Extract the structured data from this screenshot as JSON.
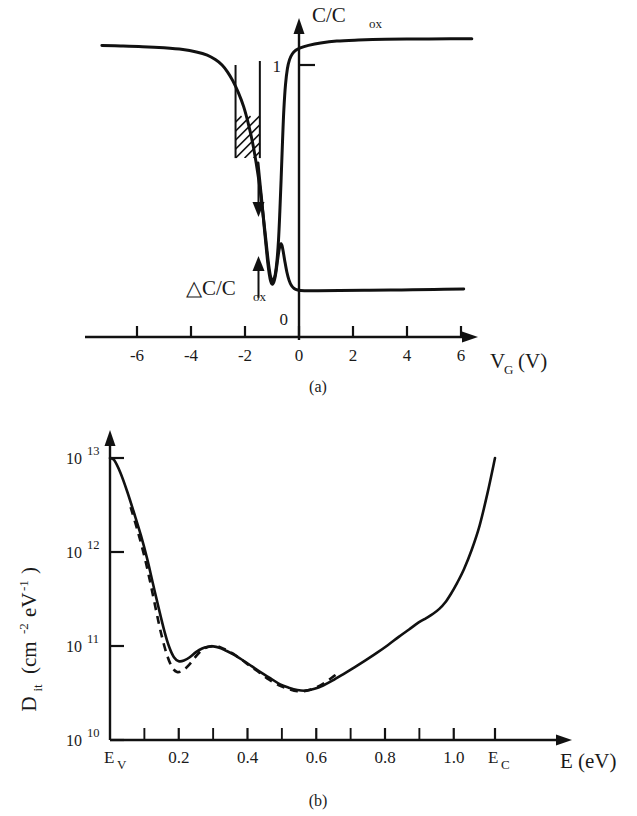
{
  "figure": {
    "panels": [
      {
        "id": "a",
        "caption": "(a)",
        "chart_data": {
          "type": "line",
          "title": "",
          "xlabel": "V_G (V)",
          "ylabel": "C/C_ox",
          "xlabel_base": "V",
          "xlabel_sub": "G",
          "xlabel_unit": "(V)",
          "ylabel_base": "C/C",
          "ylabel_sub": "ox",
          "x_ticks": [
            -6,
            -4,
            -2,
            0,
            2,
            4,
            6
          ],
          "x_tick_labels": [
            "-6",
            "-4",
            "-2",
            "0",
            "2",
            "4",
            "6"
          ],
          "xlim": [
            -7.4,
            7.0
          ],
          "y_tick_labels": [
            "1",
            "0"
          ],
          "y_tick_values": [
            1,
            0
          ],
          "ylim": [
            -0.12,
            1.28
          ],
          "grid": false,
          "legend": false,
          "annotations": [
            {
              "name": "delta-c-label",
              "text": "△C/C",
              "sub": "ox",
              "x": -2.1,
              "y": 0.12
            },
            {
              "name": "hatched-band",
              "x_from": -2.35,
              "x_to": -1.45,
              "y_top": 1.0,
              "y_bottom": 0.62
            },
            {
              "name": "down-arrow",
              "x": -1.5,
              "y_from": 0.57,
              "y_to": 0.38
            },
            {
              "name": "up-arrow",
              "x": -1.5,
              "y_from": 0.05,
              "y_to": 0.22
            }
          ],
          "series": [
            {
              "name": "high-frequency-cv-curve",
              "style": "solid",
              "points": [
                [
                  -7.3,
                  1.08
                ],
                [
                  -6.6,
                  1.078
                ],
                [
                  -5.8,
                  1.075
                ],
                [
                  -5.0,
                  1.07
                ],
                [
                  -4.3,
                  1.063
                ],
                [
                  -3.8,
                  1.053
                ],
                [
                  -3.4,
                  1.04
                ],
                [
                  -3.1,
                  1.022
                ],
                [
                  -2.85,
                  1.0
                ],
                [
                  -2.65,
                  0.972
                ],
                [
                  -2.45,
                  0.935
                ],
                [
                  -2.25,
                  0.888
                ],
                [
                  -2.05,
                  0.83
                ],
                [
                  -1.88,
                  0.762
                ],
                [
                  -1.72,
                  0.684
                ],
                [
                  -1.58,
                  0.596
                ],
                [
                  -1.46,
                  0.508
                ],
                [
                  -1.36,
                  0.418
                ],
                [
                  -1.27,
                  0.33
                ],
                [
                  -1.19,
                  0.248
                ],
                [
                  -1.12,
                  0.182
                ],
                [
                  -1.06,
                  0.14
                ],
                [
                  -1.0,
                  0.122
                ],
                [
                  -0.94,
                  0.124
                ],
                [
                  -0.88,
                  0.145
                ],
                [
                  -0.82,
                  0.196
                ],
                [
                  -0.76,
                  0.283
                ],
                [
                  -0.71,
                  0.4
                ],
                [
                  -0.66,
                  0.54
                ],
                [
                  -0.61,
                  0.69
                ],
                [
                  -0.56,
                  0.82
                ],
                [
                  -0.5,
                  0.92
                ],
                [
                  -0.43,
                  0.985
                ],
                [
                  -0.35,
                  1.022
                ],
                [
                  -0.25,
                  1.045
                ],
                [
                  -0.12,
                  1.06
                ],
                [
                  0.05,
                  1.07
                ],
                [
                  0.35,
                  1.08
                ],
                [
                  0.8,
                  1.09
                ],
                [
                  1.4,
                  1.098
                ],
                [
                  2.2,
                  1.102
                ],
                [
                  3.2,
                  1.105
                ],
                [
                  4.4,
                  1.106
                ],
                [
                  5.6,
                  1.107
                ],
                [
                  6.4,
                  1.107
                ]
              ]
            },
            {
              "name": "low-frequency-cv-curve",
              "style": "solid",
              "points": [
                [
                  -1.52,
                  0.6
                ],
                [
                  -1.44,
                  0.512
                ],
                [
                  -1.36,
                  0.424
                ],
                [
                  -1.29,
                  0.34
                ],
                [
                  -1.22,
                  0.262
                ],
                [
                  -1.16,
                  0.196
                ],
                [
                  -1.1,
                  0.146
                ],
                [
                  -1.05,
                  0.118
                ],
                [
                  -1.0,
                  0.106
                ],
                [
                  -0.96,
                  0.108
                ],
                [
                  -0.91,
                  0.122
                ],
                [
                  -0.86,
                  0.15
                ],
                [
                  -0.81,
                  0.19
                ],
                [
                  -0.76,
                  0.23
                ],
                [
                  -0.72,
                  0.255
                ],
                [
                  -0.68,
                  0.27
                ],
                [
                  -0.63,
                  0.263
                ],
                [
                  -0.58,
                  0.236
                ],
                [
                  -0.52,
                  0.196
                ],
                [
                  -0.45,
                  0.155
                ],
                [
                  -0.37,
                  0.122
                ],
                [
                  -0.28,
                  0.1
                ],
                [
                  -0.18,
                  0.088
                ],
                [
                  -0.05,
                  0.082
                ],
                [
                  0.2,
                  0.079
                ],
                [
                  0.7,
                  0.079
                ],
                [
                  1.5,
                  0.08
                ],
                [
                  2.6,
                  0.081
                ],
                [
                  3.8,
                  0.082
                ],
                [
                  5.0,
                  0.084
                ],
                [
                  6.1,
                  0.086
                ]
              ]
            }
          ]
        }
      },
      {
        "id": "b",
        "caption": "(b)",
        "chart_data": {
          "type": "line",
          "title": "",
          "xlabel": "E (eV)",
          "ylabel": "D_it (cm^-2 eV^-1)",
          "xlabel_base": "E",
          "xlabel_unit": "(eV)",
          "ylabel_base": "D",
          "ylabel_sub": "it",
          "ylabel_unit_open": "(cm",
          "ylabel_unit_exp1": "-2",
          "ylabel_unit_mid": "eV",
          "ylabel_unit_exp2": "-1",
          "ylabel_unit_close": ")",
          "x_tick_labels": [
            "E_V",
            "0.2",
            "0.4",
            "0.6",
            "0.8",
            "1.0",
            "E_C"
          ],
          "x_major_ticks": [
            0.0,
            0.2,
            0.4,
            0.6,
            0.8,
            1.0,
            1.12
          ],
          "x_minor_ticks": [
            0.1,
            0.3,
            0.5,
            0.7,
            0.9
          ],
          "x_end_labels": {
            "left_base": "E",
            "left_sub": "V",
            "right_base": "E",
            "right_sub": "C"
          },
          "xlim": [
            0.0,
            1.3
          ],
          "y_tick_labels": [
            "10",
            "10",
            "10",
            "10"
          ],
          "y_tick_exponents": [
            "13",
            "12",
            "11",
            "10"
          ],
          "y_tick_values": [
            10000000000000.0,
            1000000000000.0,
            100000000000.0,
            10000000000.0
          ],
          "ylim": [
            10000000000.0,
            10000000000000.0
          ],
          "log_y": true,
          "grid": false,
          "legend": false,
          "series": [
            {
              "name": "dit-solid-curve",
              "style": "solid",
              "x": [
                0.0,
                0.012,
                0.03,
                0.05,
                0.07,
                0.09,
                0.108,
                0.125,
                0.142,
                0.158,
                0.172,
                0.186,
                0.2,
                0.215,
                0.232,
                0.25,
                0.268,
                0.285,
                0.3,
                0.318,
                0.338,
                0.36,
                0.385,
                0.412,
                0.44,
                0.468,
                0.495,
                0.52,
                0.545,
                0.57,
                0.595,
                0.62,
                0.648,
                0.678,
                0.71,
                0.742,
                0.775,
                0.808,
                0.84,
                0.87,
                0.898,
                0.92,
                0.94,
                0.958,
                0.975,
                0.992,
                1.01,
                1.03,
                1.052,
                1.075,
                1.098,
                1.12
              ],
              "y": [
                10000000000000.0,
                9500000000000.0,
                7000000000000.0,
                4400000000000.0,
                2600000000000.0,
                1500000000000.0,
                850000000000.0,
                460000000000.0,
                250000000000.0,
                145000000000.0,
                98000000000.0,
                76000000000.0,
                69000000000.0,
                70000000000.0,
                76000000000.0,
                86000000000.0,
                94000000000.0,
                98000000000.0,
                99000000000.0,
                96000000000.0,
                89000000000.0,
                81000000000.0,
                71000000000.0,
                61000000000.0,
                52000000000.0,
                45000000000.0,
                39000000000.0,
                36000000000.0,
                34000000000.0,
                33500000000.0,
                35000000000.0,
                38000000000.0,
                43000000000.0,
                50000000000.0,
                59000000000.0,
                70000000000.0,
                84000000000.0,
                102000000000.0,
                125000000000.0,
                150000000000.0,
                178000000000.0,
                198000000000.0,
                220000000000.0,
                248000000000.0,
                290000000000.0,
                360000000000.0,
                470000000000.0,
                660000000000.0,
                1050000000000.0,
                1900000000000.0,
                4200000000000.0,
                10000000000000.0
              ]
            },
            {
              "name": "dit-dashed-curve",
              "style": "dashed",
              "x": [
                0.06,
                0.08,
                0.1,
                0.118,
                0.135,
                0.15,
                0.165,
                0.18,
                0.195,
                0.212,
                0.23,
                0.248,
                0.265,
                0.282,
                0.298,
                0.315,
                0.335,
                0.358,
                0.382,
                0.408,
                0.435,
                0.462,
                0.49,
                0.518,
                0.545,
                0.572,
                0.598,
                0.622,
                0.645,
                0.665
              ],
              "y": [
                3000000000000.0,
                1700000000000.0,
                900000000000.0,
                460000000000.0,
                230000000000.0,
                130000000000.0,
                82000000000.0,
                60000000000.0,
                53000000000.0,
                55000000000.0,
                63000000000.0,
                76000000000.0,
                89000000000.0,
                97000000000.0,
                100000000000.0,
                99000000000.0,
                92000000000.0,
                83000000000.0,
                72000000000.0,
                61000000000.0,
                52000000000.0,
                44000000000.0,
                38500000000.0,
                35000000000.0,
                33000000000.0,
                33500000000.0,
                36000000000.0,
                40000000000.0,
                46000000000.0,
                52000000000.0
              ]
            }
          ]
        }
      }
    ]
  }
}
